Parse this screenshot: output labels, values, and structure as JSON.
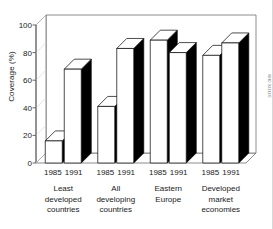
{
  "chart_data": {
    "type": "bar",
    "title": "",
    "xlabel": "",
    "ylabel": "Coverage (%)",
    "ylim": [
      0,
      100
    ],
    "yticks": [
      0,
      20,
      40,
      60,
      80,
      100
    ],
    "ytick_labels": [
      "0",
      "20",
      "40",
      "60",
      "80",
      "100"
    ],
    "grid": false,
    "legend": "none",
    "style": "3d-bar",
    "categories": [
      "Least developed countries",
      "All developing countries",
      "Eastern Europe",
      "Developed market economies"
    ],
    "series": [
      {
        "name": "1985",
        "values": [
          16,
          41,
          89,
          78
        ]
      },
      {
        "name": "1991",
        "values": [
          68,
          83,
          80,
          87
        ]
      }
    ],
    "groups": [
      {
        "label_lines": [
          "Least",
          "developed",
          "countries"
        ],
        "years": [
          "1985",
          "1991"
        ],
        "bars": [
          {
            "year": "1985",
            "value": 16,
            "face": "#ffffff"
          },
          {
            "year": "1991",
            "value": 68,
            "face": "#ffffff"
          }
        ]
      },
      {
        "label_lines": [
          "All",
          "developing",
          "countries"
        ],
        "years": [
          "1985",
          "1991"
        ],
        "bars": [
          {
            "year": "1985",
            "value": 41,
            "face": "#ffffff"
          },
          {
            "year": "1991",
            "value": 83,
            "face": "#ffffff"
          }
        ]
      },
      {
        "label_lines": [
          "Eastern",
          "Europe"
        ],
        "years": [
          "1985",
          "1991"
        ],
        "bars": [
          {
            "year": "1985",
            "value": 89,
            "face": "#ffffff"
          },
          {
            "year": "1991",
            "value": 80,
            "face": "#ffffff"
          }
        ]
      },
      {
        "label_lines": [
          "Developed",
          "market",
          "economies"
        ],
        "years": [
          "1985",
          "1991"
        ],
        "bars": [
          {
            "year": "1985",
            "value": 78,
            "face": "#ffffff"
          },
          {
            "year": "1991",
            "value": 87,
            "face": "#ffffff"
          }
        ]
      }
    ],
    "colors": {
      "bar_front": "#ffffff",
      "bar_side": "#000000",
      "bar_top": "#ffffff",
      "outline": "#000000",
      "axis": "#555555",
      "text": "#1a1a1a",
      "background": "#ffffff"
    }
  },
  "labels": {
    "ylabel": "Coverage (%)",
    "credit": "WHO 93313/E"
  }
}
